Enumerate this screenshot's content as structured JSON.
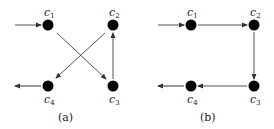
{
  "figure": {
    "panels": [
      {
        "caption": "(a)",
        "nodes": [
          {
            "id": "c1",
            "base": "c",
            "sub": "1"
          },
          {
            "id": "c2",
            "base": "c",
            "sub": "2"
          },
          {
            "id": "c3",
            "base": "c",
            "sub": "3"
          },
          {
            "id": "c4",
            "base": "c",
            "sub": "4"
          }
        ],
        "edges": [
          {
            "from": "input",
            "to": "c1"
          },
          {
            "from": "c1",
            "to": "c3"
          },
          {
            "from": "c3",
            "to": "c2"
          },
          {
            "from": "c2",
            "to": "c4"
          },
          {
            "from": "c4",
            "to": "output"
          }
        ]
      },
      {
        "caption": "(b)",
        "nodes": [
          {
            "id": "c1",
            "base": "c",
            "sub": "1"
          },
          {
            "id": "c2",
            "base": "c",
            "sub": "2"
          },
          {
            "id": "c3",
            "base": "c",
            "sub": "3"
          },
          {
            "id": "c4",
            "base": "c",
            "sub": "4"
          }
        ],
        "edges": [
          {
            "from": "input",
            "to": "c1"
          },
          {
            "from": "c1",
            "to": "c2"
          },
          {
            "from": "c2",
            "to": "c3"
          },
          {
            "from": "c3",
            "to": "c4"
          },
          {
            "from": "c4",
            "to": "output"
          }
        ]
      }
    ]
  }
}
